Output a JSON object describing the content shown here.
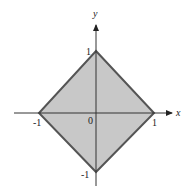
{
  "diagram": {
    "axes": {
      "x_label": "x",
      "y_label": "y",
      "origin_label": "0"
    },
    "ticks": {
      "x_pos": "1",
      "x_neg": "-1",
      "y_pos": "1",
      "y_neg": "-1"
    },
    "region": {
      "vertices": [
        [
          0,
          1
        ],
        [
          1,
          0
        ],
        [
          0,
          -1
        ],
        [
          -1,
          0
        ]
      ],
      "fill_color": "#c8c8c8",
      "stroke_color": "#555555"
    },
    "colors": {
      "axis": "#333333",
      "background": "#ffffff"
    }
  }
}
